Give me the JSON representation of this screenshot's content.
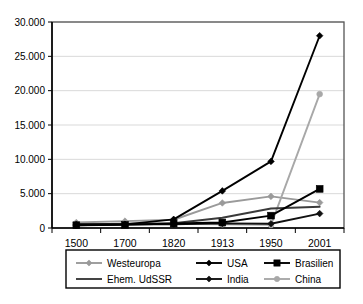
{
  "chart_data": {
    "type": "line",
    "title": "",
    "subtitle": "",
    "xlabel": "",
    "ylabel": "",
    "categories": [
      "1500",
      "1700",
      "1820",
      "1913",
      "1950",
      "2001"
    ],
    "ylim": [
      0,
      30000
    ],
    "ytick_labels": [
      "0",
      "5.000",
      "10.000",
      "15.000",
      "20.000",
      "25.000",
      "30.000"
    ],
    "ytick_values": [
      0,
      5000,
      10000,
      15000,
      20000,
      25000,
      30000
    ],
    "grid": true,
    "legend_position": "bottom",
    "series": [
      {
        "name": "Westeuropa",
        "values": [
          800,
          1000,
          1200,
          3650,
          4600,
          3700
        ],
        "color": "#9a9a9a",
        "marker": "diamond"
      },
      {
        "name": "USA",
        "values": [
          400,
          530,
          1260,
          5400,
          9700,
          28000
        ],
        "color": "#000000",
        "marker": "diamond"
      },
      {
        "name": "Brasilien",
        "values": [
          400,
          460,
          650,
          800,
          1800,
          5700
        ],
        "color": "#000000",
        "marker": "square"
      },
      {
        "name": "Ehem. UdSSR",
        "values": [
          500,
          610,
          690,
          1490,
          2840,
          3100
        ],
        "color": "#3a3a3a",
        "marker": "none"
      },
      {
        "name": "India",
        "values": [
          550,
          550,
          530,
          670,
          620,
          2100
        ],
        "color": "#111111",
        "marker": "diamond"
      },
      {
        "name": "China",
        "values": [
          600,
          600,
          600,
          550,
          450,
          19500
        ],
        "color": "#a8a8a8",
        "marker": "circle"
      }
    ],
    "legend_rows": [
      [
        "Westeuropa",
        "USA",
        "Brasilien"
      ],
      [
        "Ehem. UdSSR",
        "India",
        "China"
      ]
    ]
  }
}
